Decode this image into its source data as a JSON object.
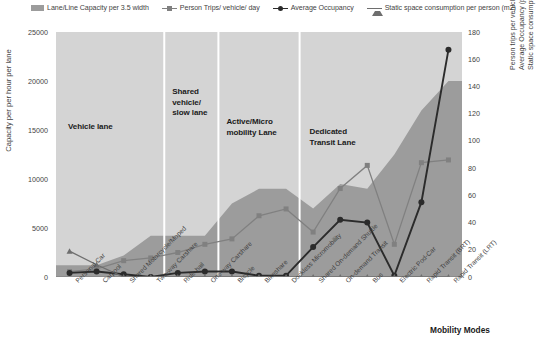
{
  "legend": {
    "items": [
      {
        "label": "Lane/Line Capacity per 3.5 width",
        "marker": "area-swatch",
        "color": "#9c9c9c"
      },
      {
        "label": "Person Trips/ vehicle/ day",
        "marker": "square-marker",
        "color": "#808080"
      },
      {
        "label": "Average Occupancy",
        "marker": "circle-marker",
        "color": "#2b2b2b"
      },
      {
        "label": "Static space consumption per person (m2)",
        "marker": "triangle-marker",
        "color": "#6e6e6e"
      }
    ]
  },
  "axes": {
    "left_title": "Capacity per per hour per lane",
    "left_ticks": [
      "25000",
      "20000",
      "15000",
      "10000",
      "5000",
      "0"
    ],
    "right_title_lines": [
      "Person trips per vehicle per day",
      "Average Occupancy (peak period)",
      "Static space consumption per person (m2)"
    ],
    "right_ticks": [
      "180",
      "160",
      "140",
      "120",
      "100",
      "80",
      "60",
      "40",
      "20",
      "0"
    ],
    "x_title": "Mobility Modes"
  },
  "zones": [
    {
      "label": "Vehicle lane"
    },
    {
      "label": "Shared vehicle/ slow lane"
    },
    {
      "label": "Active/Micro mobility Lane"
    },
    {
      "label": "Dedicated Transit Lane"
    }
  ],
  "chart_data": {
    "type": "area",
    "title": "",
    "xlabel": "Mobility Modes",
    "ylabel": "Capacity per per hour per lane",
    "ylabel_secondary": "Person trips per vehicle per day / Average Occupancy (peak period) / Static space consumption per person (m2)",
    "ylim": [
      0,
      25000
    ],
    "ylim_secondary": [
      0,
      180
    ],
    "grid": false,
    "legend_position": "top",
    "categories": [
      "Personal Car",
      "Carpool",
      "Shared Motorcycle/Moped",
      "Two-way Carshare",
      "Ride-hail",
      "One-way Carshare",
      "Bicycle",
      "Bikeshare",
      "Dockless Micromobility",
      "Shared On-demand Shuttle",
      "On-demand Transit",
      "Bus",
      "Electric Pod-Car",
      "Rapid Transit (BRT)",
      "Rapid Transit (LRT)"
    ],
    "series": [
      {
        "name": "Lane/Line Capacity per 3.5 width",
        "axis": "left",
        "type": "area",
        "color": "#9c9c9c",
        "values": [
          1200,
          1200,
          2200,
          4200,
          4200,
          4200,
          7500,
          9000,
          9000,
          7000,
          9500,
          9000,
          12500,
          17000,
          20000
        ]
      },
      {
        "name": "Person Trips/ vehicle/ day",
        "axis": "right",
        "type": "line",
        "color": "#808080",
        "values": [
          4,
          6,
          12,
          14,
          18,
          24,
          28,
          45,
          50,
          33,
          65,
          82,
          24,
          84,
          86
        ]
      },
      {
        "name": "Average Occupancy",
        "axis": "right",
        "type": "line",
        "color": "#2b2b2b",
        "values": [
          3,
          4,
          2,
          0,
          3,
          4,
          4,
          1,
          1,
          22,
          42,
          40,
          1,
          55,
          167
        ]
      },
      {
        "name": "Static space consumption per person (m2)",
        "axis": "right",
        "type": "line",
        "color": "#6e6e6e",
        "values": [
          19,
          9,
          0,
          0,
          0,
          0,
          0,
          0,
          0,
          0,
          0,
          0,
          0,
          0,
          0
        ]
      }
    ]
  }
}
